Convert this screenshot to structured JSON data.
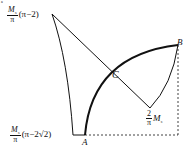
{
  "figure": {
    "corner_mark": "a",
    "labels": {
      "top_left": {
        "num": "M",
        "num_sub": "s",
        "den": "π",
        "expr": "(π−2)"
      },
      "bottom_left": {
        "num": "M",
        "num_sub": "s",
        "den": "π",
        "expr": "(π−2√2)"
      },
      "right_lower": {
        "num": "2",
        "den": "π",
        "tail": "M",
        "tail_sub": "s"
      },
      "point_A": "A",
      "point_B": "B",
      "point_C": "C"
    },
    "colors": {
      "stroke": "#111111",
      "background": "#ffffff"
    }
  }
}
